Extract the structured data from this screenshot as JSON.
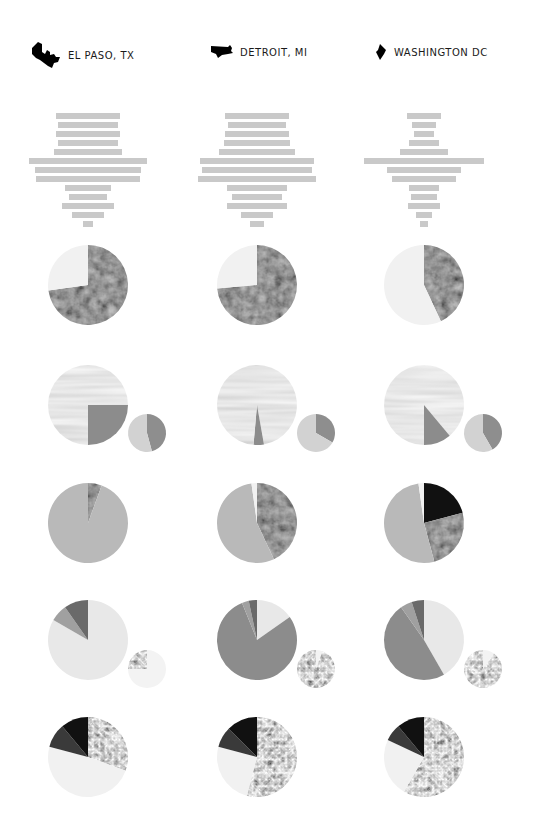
{
  "cities": [
    {
      "name": "EL PASO, TX",
      "icon": "el-paso-shape-icon",
      "x": 30,
      "cx": 88
    },
    {
      "name": "DETROIT, MI",
      "icon": "detroit-shape-icon",
      "x": 206,
      "cx": 257
    },
    {
      "name": "WASHINGTON DC",
      "icon": "washington-dc-shape-icon",
      "x": 368,
      "cx": 424
    }
  ],
  "colors": {
    "bar": "#c9c9c9",
    "light": "#eeeeee",
    "lighter": "#f4f4f4",
    "mid_gray": "#a6a6a6",
    "dark_gray": "#7b7b7b",
    "darker_gray": "#5a5a5a",
    "black": "#111111",
    "pie_gray": "#8c8c8c",
    "pie_light": "#d6d6d6"
  },
  "chart_data": [
    {
      "type": "bar",
      "title": "Population pyramid (horizontal bars, centered)",
      "orientation": "horizontal-centered",
      "row_y_start": 113,
      "row_step": 9,
      "bar_height": 6,
      "series": [
        {
          "name": "EL PASO, TX",
          "values": [
            64,
            60,
            64,
            60,
            68,
            118,
            106,
            104,
            46,
            38,
            52,
            32,
            10
          ]
        },
        {
          "name": "DETROIT, MI",
          "values": [
            64,
            58,
            64,
            66,
            76,
            114,
            110,
            118,
            60,
            50,
            60,
            32,
            14
          ]
        },
        {
          "name": "WASHINGTON DC",
          "values": [
            34,
            24,
            20,
            30,
            48,
            120,
            74,
            64,
            30,
            26,
            32,
            16,
            8
          ]
        }
      ]
    },
    {
      "type": "pie",
      "title": "Row 1 — dark satellite texture vs light",
      "series": [
        {
          "name": "EL PASO, TX",
          "slices": [
            {
              "label": "texture-dark",
              "start": 0,
              "end": 262
            },
            {
              "label": "light",
              "start": 262,
              "end": 360
            }
          ]
        },
        {
          "name": "DETROIT, MI",
          "slices": [
            {
              "label": "texture-dark",
              "start": 0,
              "end": 265
            },
            {
              "label": "light",
              "start": 265,
              "end": 360
            }
          ]
        },
        {
          "name": "WASHINGTON DC",
          "slices": [
            {
              "label": "texture-dark",
              "start": 0,
              "end": 155
            },
            {
              "label": "light",
              "start": 155,
              "end": 360
            }
          ]
        }
      ]
    },
    {
      "type": "pie",
      "title": "Row 2 — marble texture with flat gray wedge, plus small secondary pie",
      "series": [
        {
          "name": "EL PASO, TX",
          "slices": [
            {
              "label": "marble",
              "start": 0,
              "end": 90
            },
            {
              "label": "gray",
              "start": 90,
              "end": 180
            },
            {
              "label": "marble",
              "start": 180,
              "end": 360
            }
          ],
          "small": [
            {
              "label": "dark",
              "start": 0,
              "end": 165
            },
            {
              "label": "light",
              "start": 165,
              "end": 360
            }
          ]
        },
        {
          "name": "DETROIT, MI",
          "slices": [
            {
              "label": "marble",
              "start": 0,
              "end": 170
            },
            {
              "label": "gray",
              "start": 170,
              "end": 185
            },
            {
              "label": "marble",
              "start": 185,
              "end": 360
            }
          ],
          "small": [
            {
              "label": "dark",
              "start": 0,
              "end": 120
            },
            {
              "label": "light",
              "start": 120,
              "end": 360
            }
          ]
        },
        {
          "name": "WASHINGTON DC",
          "slices": [
            {
              "label": "marble",
              "start": 0,
              "end": 140
            },
            {
              "label": "gray",
              "start": 140,
              "end": 180
            },
            {
              "label": "marble",
              "start": 180,
              "end": 360
            }
          ],
          "small": [
            {
              "label": "dark",
              "start": 0,
              "end": 150
            },
            {
              "label": "light",
              "start": 150,
              "end": 360
            }
          ]
        }
      ]
    },
    {
      "type": "pie",
      "title": "Row 3 — gray with dark texture wedge",
      "series": [
        {
          "name": "EL PASO, TX",
          "slices": [
            {
              "label": "texture-dark",
              "start": 0,
              "end": 20
            },
            {
              "label": "gray",
              "start": 20,
              "end": 360
            }
          ]
        },
        {
          "name": "DETROIT, MI",
          "slices": [
            {
              "label": "texture-dark",
              "start": 0,
              "end": 155
            },
            {
              "label": "gray",
              "start": 155,
              "end": 352
            },
            {
              "label": "light",
              "start": 352,
              "end": 360
            }
          ]
        },
        {
          "name": "WASHINGTON DC",
          "slices": [
            {
              "label": "black",
              "start": 0,
              "end": 75
            },
            {
              "label": "texture-dark",
              "start": 75,
              "end": 165
            },
            {
              "label": "gray",
              "start": 165,
              "end": 352
            },
            {
              "label": "light",
              "start": 352,
              "end": 360
            }
          ]
        }
      ]
    },
    {
      "type": "pie",
      "title": "Row 4 — light / gray / dark wedges, plus small texture pie",
      "series": [
        {
          "name": "EL PASO, TX",
          "slices": [
            {
              "label": "light",
              "start": 0,
              "end": 300
            },
            {
              "label": "mid",
              "start": 300,
              "end": 325
            },
            {
              "label": "dark",
              "start": 325,
              "end": 360
            }
          ],
          "small": [
            {
              "label": "light",
              "start": 0,
              "end": 270
            },
            {
              "label": "texture",
              "start": 270,
              "end": 360
            }
          ]
        },
        {
          "name": "DETROIT, MI",
          "slices": [
            {
              "label": "light",
              "start": 0,
              "end": 55
            },
            {
              "label": "gray",
              "start": 55,
              "end": 338
            },
            {
              "label": "mid",
              "start": 338,
              "end": 348
            },
            {
              "label": "dark",
              "start": 348,
              "end": 360
            }
          ],
          "small": [
            {
              "label": "light",
              "start": 0,
              "end": 20
            },
            {
              "label": "texture",
              "start": 20,
              "end": 360
            }
          ]
        },
        {
          "name": "WASHINGTON DC",
          "slices": [
            {
              "label": "light",
              "start": 0,
              "end": 150
            },
            {
              "label": "gray",
              "start": 150,
              "end": 325
            },
            {
              "label": "mid",
              "start": 325,
              "end": 342
            },
            {
              "label": "dark",
              "start": 342,
              "end": 360
            }
          ],
          "small": [
            {
              "label": "light",
              "start": 0,
              "end": 35
            },
            {
              "label": "texture",
              "start": 35,
              "end": 360
            }
          ]
        }
      ]
    },
    {
      "type": "pie",
      "title": "Row 5 — texture / light / dark",
      "series": [
        {
          "name": "EL PASO, TX",
          "slices": [
            {
              "label": "texture",
              "start": 0,
              "end": 110
            },
            {
              "label": "light",
              "start": 110,
              "end": 285
            },
            {
              "label": "darker",
              "start": 285,
              "end": 320
            },
            {
              "label": "black",
              "start": 320,
              "end": 360
            }
          ]
        },
        {
          "name": "DETROIT, MI",
          "slices": [
            {
              "label": "texture",
              "start": 0,
              "end": 195
            },
            {
              "label": "light",
              "start": 195,
              "end": 285
            },
            {
              "label": "darker",
              "start": 285,
              "end": 315
            },
            {
              "label": "black",
              "start": 315,
              "end": 360
            }
          ]
        },
        {
          "name": "WASHINGTON DC",
          "slices": [
            {
              "label": "texture",
              "start": 0,
              "end": 210
            },
            {
              "label": "light",
              "start": 210,
              "end": 295
            },
            {
              "label": "darker",
              "start": 295,
              "end": 320
            },
            {
              "label": "black",
              "start": 320,
              "end": 360
            }
          ]
        }
      ]
    }
  ]
}
